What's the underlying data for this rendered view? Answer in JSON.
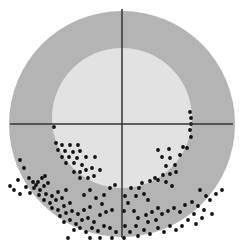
{
  "figure": {
    "width": 239,
    "height": 248,
    "background": "#ffffff",
    "outer_circle": {
      "cx": 122,
      "cy": 124,
      "r": 113,
      "fill": "#b4b4b4"
    },
    "inner_circle": {
      "cx": 122,
      "cy": 118,
      "r": 70,
      "fill": "#e2e2e2"
    },
    "crosshair": {
      "color": "#333333",
      "width": 1.5,
      "horizontal": {
        "x1": 10,
        "x2": 233,
        "y": 124
      },
      "vertical": {
        "x": 122,
        "y1": 9,
        "y2": 238
      }
    },
    "dot_color": "#111111",
    "dot_radius": 1.9,
    "dots": [
      [
        54,
        127
      ],
      [
        56,
        143
      ],
      [
        62,
        145
      ],
      [
        70,
        145
      ],
      [
        78,
        145
      ],
      [
        58,
        150
      ],
      [
        65,
        151
      ],
      [
        73,
        152
      ],
      [
        80,
        151
      ],
      [
        62,
        157
      ],
      [
        69,
        157
      ],
      [
        77,
        158
      ],
      [
        86,
        157
      ],
      [
        66,
        163
      ],
      [
        74,
        163
      ],
      [
        82,
        165
      ],
      [
        95,
        157
      ],
      [
        74,
        172
      ],
      [
        80,
        172
      ],
      [
        86,
        170
      ],
      [
        92,
        168
      ],
      [
        80,
        178
      ],
      [
        88,
        178
      ],
      [
        94,
        176
      ],
      [
        100,
        170
      ],
      [
        20,
        160
      ],
      [
        24,
        168
      ],
      [
        29,
        178
      ],
      [
        33,
        182
      ],
      [
        36,
        185
      ],
      [
        38,
        182
      ],
      [
        42,
        178
      ],
      [
        45,
        176
      ],
      [
        34,
        188
      ],
      [
        40,
        190
      ],
      [
        44,
        186
      ],
      [
        48,
        183
      ],
      [
        39,
        195
      ],
      [
        46,
        194
      ],
      [
        52,
        196
      ],
      [
        58,
        192
      ],
      [
        44,
        200
      ],
      [
        50,
        203
      ],
      [
        56,
        200
      ],
      [
        62,
        198
      ],
      [
        52,
        208
      ],
      [
        58,
        210
      ],
      [
        64,
        206
      ],
      [
        70,
        203
      ],
      [
        18,
        180
      ],
      [
        14,
        190
      ],
      [
        10,
        186
      ],
      [
        26,
        187
      ],
      [
        30,
        193
      ],
      [
        20,
        194
      ],
      [
        60,
        216
      ],
      [
        66,
        213
      ],
      [
        72,
        211
      ],
      [
        78,
        214
      ],
      [
        84,
        210
      ],
      [
        90,
        207
      ],
      [
        64,
        222
      ],
      [
        70,
        220
      ],
      [
        76,
        224
      ],
      [
        82,
        220
      ],
      [
        88,
        218
      ],
      [
        94,
        222
      ],
      [
        100,
        215
      ],
      [
        106,
        212
      ],
      [
        112,
        210
      ],
      [
        74,
        230
      ],
      [
        80,
        228
      ],
      [
        86,
        232
      ],
      [
        92,
        228
      ],
      [
        98,
        231
      ],
      [
        104,
        226
      ],
      [
        110,
        228
      ],
      [
        116,
        232
      ],
      [
        68,
        238
      ],
      [
        90,
        238
      ],
      [
        100,
        238
      ],
      [
        112,
        238
      ],
      [
        96,
        198
      ],
      [
        104,
        195
      ],
      [
        110,
        188
      ],
      [
        115,
        185
      ],
      [
        66,
        190
      ],
      [
        84,
        195
      ],
      [
        90,
        190
      ],
      [
        102,
        204
      ],
      [
        190,
        112
      ],
      [
        191,
        118
      ],
      [
        191,
        124
      ],
      [
        190,
        130
      ],
      [
        191,
        137
      ],
      [
        187,
        148
      ],
      [
        158,
        150
      ],
      [
        169,
        149
      ],
      [
        162,
        157
      ],
      [
        170,
        158
      ],
      [
        166,
        166
      ],
      [
        175,
        165
      ],
      [
        180,
        155
      ],
      [
        163,
        175
      ],
      [
        170,
        174
      ],
      [
        176,
        172
      ],
      [
        158,
        180
      ],
      [
        166,
        182
      ],
      [
        172,
        186
      ],
      [
        183,
        147
      ],
      [
        131,
        188
      ],
      [
        139,
        188
      ],
      [
        136,
        196
      ],
      [
        144,
        194
      ],
      [
        150,
        181
      ],
      [
        155,
        178
      ],
      [
        148,
        200
      ],
      [
        142,
        183
      ],
      [
        125,
        196
      ],
      [
        128,
        203
      ],
      [
        124,
        211
      ],
      [
        134,
        211
      ],
      [
        138,
        218
      ],
      [
        146,
        215
      ],
      [
        152,
        212
      ],
      [
        158,
        208
      ],
      [
        162,
        214
      ],
      [
        168,
        211
      ],
      [
        174,
        208
      ],
      [
        180,
        212
      ],
      [
        185,
        205
      ],
      [
        192,
        202
      ],
      [
        198,
        206
      ],
      [
        204,
        210
      ],
      [
        210,
        200
      ],
      [
        216,
        194
      ],
      [
        222,
        190
      ],
      [
        212,
        214
      ],
      [
        202,
        218
      ],
      [
        196,
        224
      ],
      [
        188,
        220
      ],
      [
        182,
        226
      ],
      [
        176,
        230
      ],
      [
        170,
        226
      ],
      [
        164,
        232
      ],
      [
        158,
        228
      ],
      [
        150,
        234
      ],
      [
        144,
        230
      ],
      [
        138,
        236
      ],
      [
        130,
        232
      ],
      [
        125,
        226
      ],
      [
        124,
        238
      ],
      [
        136,
        226
      ],
      [
        148,
        222
      ],
      [
        156,
        220
      ],
      [
        194,
        214
      ],
      [
        206,
        196
      ],
      [
        200,
        190
      ]
    ]
  }
}
